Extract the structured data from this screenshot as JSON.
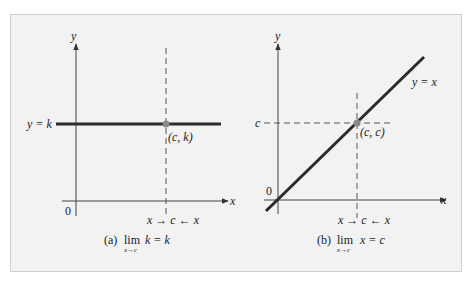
{
  "panel_a": {
    "y_axis_label": "y",
    "x_axis_label": "x",
    "origin_label": "0",
    "line_label": "y = k",
    "point_label": "(c, k)",
    "approach_label": "x → c ← x",
    "caption_prefix": "(a)",
    "caption_lim": "lim",
    "caption_sub": "x→c",
    "caption_expr": "k = k"
  },
  "panel_b": {
    "y_axis_label": "y",
    "x_axis_label": "x",
    "origin_label": "0",
    "line_label": "y = x",
    "point_label": "(c, c)",
    "c_tick_label": "c",
    "approach_label": "x → c ← x",
    "caption_prefix": "(b)",
    "caption_lim": "lim",
    "caption_sub": "x→c",
    "caption_expr": "x = c"
  },
  "colors": {
    "background": "#f2f2f2",
    "line": "#2b2b2b",
    "point": "#8a8a8a"
  }
}
